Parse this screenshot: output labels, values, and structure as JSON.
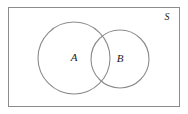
{
  "diagram": {
    "type": "venn-diagram",
    "background_color": "#ffffff",
    "universe": {
      "label": "S",
      "name": "universal-set",
      "stroke_color": "#8c8c8c",
      "fill_color": "#ffffff",
      "x": 8,
      "y": 7,
      "width": 172,
      "height": 100,
      "stroke_width": 1,
      "label_x": 167,
      "label_y": 17
    },
    "sets": [
      {
        "label": "A",
        "name": "set-a",
        "cx": 74,
        "cy": 58,
        "r": 36,
        "stroke_color": "#8c8c8c",
        "fill_color": "none",
        "stroke_width": 1,
        "label_x": 74,
        "label_y": 58
      },
      {
        "label": "B",
        "name": "set-b",
        "cx": 120,
        "cy": 59,
        "r": 29,
        "stroke_color": "#8c8c8c",
        "fill_color": "none",
        "stroke_width": 1,
        "label_x": 120,
        "label_y": 59
      }
    ],
    "intersection": {
      "name": "a-intersect-b",
      "label": ""
    }
  }
}
